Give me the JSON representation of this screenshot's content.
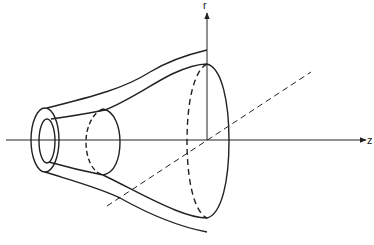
{
  "diagram": {
    "type": "3d-flared-tube-geometry",
    "axes": {
      "radial_label": "r",
      "axial_label": "z"
    },
    "colors": {
      "stroke": "#222222",
      "background": "#ffffff"
    },
    "elements": [
      "outer-tube-wall",
      "inner-bore",
      "intermediate-cross-section",
      "large-cross-section-at-r-axis",
      "dashed-depth-axis"
    ]
  }
}
